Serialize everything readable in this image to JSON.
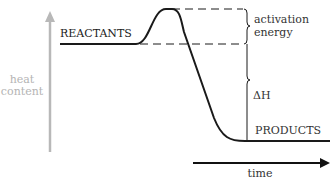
{
  "diagram": {
    "y_axis": {
      "label_line1": "heat",
      "label_line2": "content",
      "color": "#b4b4b4"
    },
    "x_axis": {
      "label": "time",
      "color": "#111111"
    },
    "reactants_label": "REACTANTS",
    "products_label": "PRODUCTS",
    "activation_label_line1": "activation",
    "activation_label_line2": "energy",
    "delta_h_label": "ΔH",
    "line_color": "#1a1a1a",
    "text_color": "#333333"
  }
}
